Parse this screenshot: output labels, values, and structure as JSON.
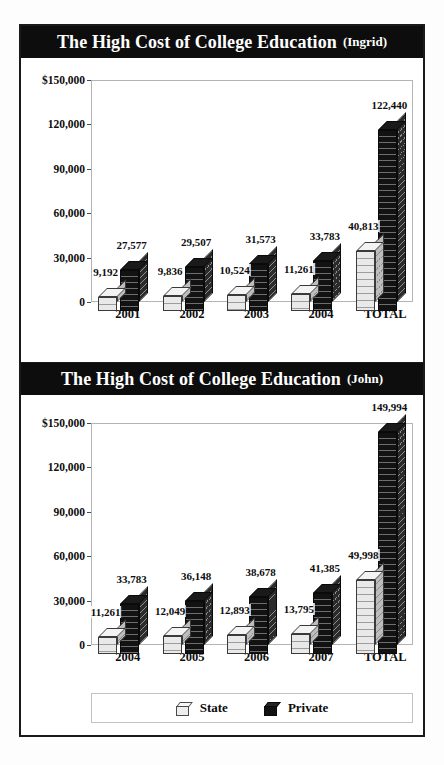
{
  "figure": {
    "background_color": "#fdfdfd",
    "frame_color": "#1a1a1a",
    "banner_color": "#0d0d0d",
    "banner_text_color": "#ffffff"
  },
  "legend": {
    "items": [
      {
        "label": "State",
        "color": "#ededed",
        "icon": "state-swatch-icon"
      },
      {
        "label": "Private",
        "color": "#121212",
        "icon": "private-swatch-icon"
      }
    ]
  },
  "chart_data": [
    {
      "type": "bar",
      "title": "The High Cost of College Education",
      "subtitle": "(Ingrid)",
      "categories": [
        "2001",
        "2002",
        "2003",
        "2004",
        "TOTAL"
      ],
      "series": [
        {
          "name": "State",
          "values": [
            9192,
            9836,
            10524,
            11261,
            40813
          ],
          "labels": [
            "9,192",
            "9,836",
            "10,524",
            "11,261",
            "40,813"
          ]
        },
        {
          "name": "Private",
          "values": [
            27577,
            29507,
            31573,
            33783,
            122440
          ],
          "labels": [
            "27,577",
            "29,507",
            "31,573",
            "33,783",
            "122,440"
          ]
        }
      ],
      "xlabel": "",
      "ylabel": "",
      "ylim": [
        0,
        150000
      ],
      "yticks": [
        0,
        30000,
        60000,
        90000,
        120000,
        150000
      ],
      "ytick_labels": [
        "0",
        "30,000",
        "60,000",
        "90,000",
        "120,000",
        "$150,000"
      ],
      "grid": false,
      "legend_position": "none"
    },
    {
      "type": "bar",
      "title": "The High Cost of College Education",
      "subtitle": "(John)",
      "categories": [
        "2004",
        "2005",
        "2006",
        "2007",
        "TOTAL"
      ],
      "series": [
        {
          "name": "State",
          "values": [
            11261,
            12049,
            12893,
            13795,
            49998
          ],
          "labels": [
            "11,261",
            "12,049",
            "12,893",
            "13,795",
            "49,998"
          ]
        },
        {
          "name": "Private",
          "values": [
            33783,
            36148,
            38678,
            41385,
            149994
          ],
          "labels": [
            "33,783",
            "36,148",
            "38,678",
            "41,385",
            "149,994"
          ]
        }
      ],
      "xlabel": "",
      "ylabel": "",
      "ylim": [
        0,
        150000
      ],
      "yticks": [
        0,
        30000,
        60000,
        90000,
        120000,
        150000
      ],
      "ytick_labels": [
        "0",
        "30,000",
        "60,000",
        "90,000",
        "120,000",
        "$150,000"
      ],
      "grid": false,
      "legend_position": "bottom"
    }
  ]
}
